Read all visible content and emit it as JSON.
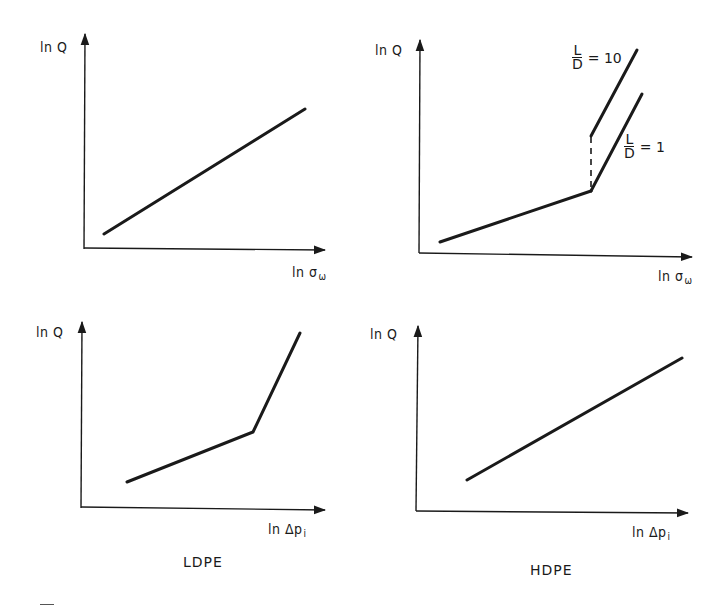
{
  "figure": {
    "panels": [
      {
        "id": "top-left",
        "y_label": "ln Q",
        "x_label_main": "ln σ",
        "x_label_sub": "ω",
        "curve": "single straight line",
        "points": [
          [
            104,
            234
          ],
          [
            305,
            109
          ]
        ]
      },
      {
        "id": "top-right",
        "y_label": "ln Q",
        "x_label_main": "ln σ",
        "x_label_sub": "ω",
        "curve": "bilinear with L/D branches",
        "base_segment": [
          [
            440,
            242
          ],
          [
            591,
            191
          ]
        ],
        "branches": [
          {
            "name": "L/D = 10",
            "num": "L",
            "den": "D",
            "value": "= 10",
            "points": [
              [
                591,
                136
              ],
              [
                637,
                50
              ]
            ]
          },
          {
            "name": "L/D = 1",
            "num": "L",
            "den": "D",
            "value": "= 1",
            "points": [
              [
                591,
                191
              ],
              [
                642,
                94
              ]
            ]
          }
        ],
        "dashed_connector": [
          [
            591,
            136
          ],
          [
            591,
            191
          ]
        ]
      },
      {
        "id": "bottom-left",
        "title": "LDPE",
        "y_label": "ln Q",
        "x_label_main": "ln Δp",
        "x_label_sub": "i",
        "curve": "bilinear",
        "points": [
          [
            127,
            482
          ],
          [
            253,
            432
          ],
          [
            300,
            333
          ]
        ]
      },
      {
        "id": "bottom-right",
        "title": "HDPE",
        "y_label": "ln Q",
        "x_label_main": "ln Δp",
        "x_label_sub": "i",
        "curve": "single straight line",
        "points": [
          [
            467,
            480
          ],
          [
            682,
            358
          ]
        ]
      }
    ],
    "line_color": "#1a1a1a"
  }
}
